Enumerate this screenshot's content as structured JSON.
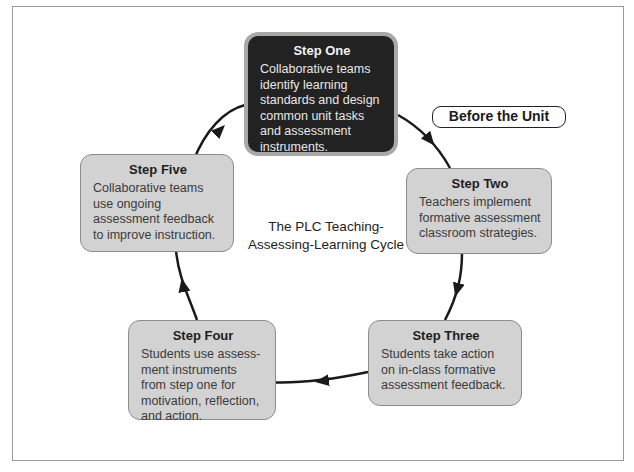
{
  "diagram": {
    "center_title": "The PLC Teaching-Assessing-Learning Cycle",
    "center_title_lines": [
      "The PLC Teaching-",
      "Assessing-Learning Cycle"
    ],
    "badge": "Before the Unit",
    "steps": [
      {
        "title": "Step One",
        "text": "Collaborative teams identify learning standards and design common unit tasks and assessment instruments.",
        "highlighted": true
      },
      {
        "title": "Step Two",
        "text": "Teachers implement formative assessment classroom strategies."
      },
      {
        "title": "Step Three",
        "text": "Students take action on in-class formative assessment feedback."
      },
      {
        "title": "Step Four",
        "text": "Students use assess-ment instruments from step one for motivation, reflection, and action."
      },
      {
        "title": "Step Five",
        "text": "Collaborative teams use ongoing assessment feedback to improve instruction."
      }
    ],
    "colors": {
      "highlight_fill": "#222222",
      "box_fill": "#d2d2d2",
      "arrow": "#1a1a1a"
    }
  }
}
